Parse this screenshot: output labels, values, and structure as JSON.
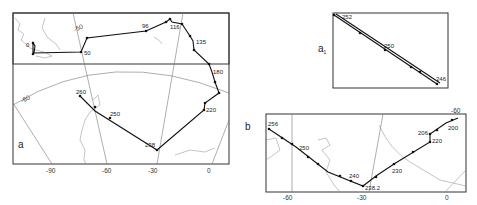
{
  "panels": {
    "a": {
      "letter": "a",
      "x_ticks": [
        "-90",
        "-60",
        "-30",
        "0"
      ],
      "lat_label": "-60",
      "lat_label_top": "-50",
      "labels": {
        "p0": "0",
        "p50": "50",
        "p96": "96",
        "p116": "116",
        "p135": "135",
        "p180": "180",
        "p220": "220",
        "p238": "238",
        "p250": "250",
        "p260": "260"
      }
    },
    "a1": {
      "letter": "a",
      "subscript": "1",
      "labels": {
        "p252": "252",
        "p250": "250",
        "p246": "246"
      }
    },
    "b": {
      "letter": "b",
      "x_ticks": [
        "-60",
        "-30",
        "0"
      ],
      "lat_label": "-60",
      "labels": {
        "p256": "256",
        "p250": "250",
        "p240": "240",
        "p238": "238.2",
        "p230": "230",
        "p220": "220",
        "p206": "206",
        "p200": "200"
      }
    }
  }
}
